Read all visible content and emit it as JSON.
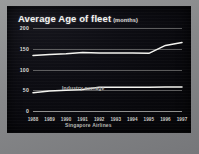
{
  "slide": {
    "title": "Average Age of fleet",
    "subtitle": "(months)"
  },
  "chart_data": {
    "type": "line",
    "title": "Average Age of fleet",
    "subtitle": "(months)",
    "xlabel": "",
    "ylabel": "months",
    "ylim": [
      0,
      200
    ],
    "yticks": [
      0,
      50,
      100,
      150,
      200
    ],
    "ytick_labels": [
      "0",
      "50",
      "100",
      "150",
      "200"
    ],
    "grid": true,
    "legend": "inline-labels",
    "categories": [
      "1988",
      "1989",
      "1990",
      "1991",
      "1992",
      "1993",
      "1994",
      "1995",
      "1996",
      "1997"
    ],
    "series": [
      {
        "name": "Industry average",
        "values": [
          134,
          136,
          138,
          141,
          140,
          140,
          140,
          139,
          158,
          165
        ]
      },
      {
        "name": "Singapore Airlines",
        "values": [
          44,
          48,
          50,
          52,
          57,
          57,
          57,
          57,
          58,
          58
        ]
      }
    ],
    "colors": {
      "line": "#f4f4f0",
      "grid": "#d7d7d2",
      "background": "#0b0b10",
      "frame": "#8f9091",
      "title_text": "#f2f2f0",
      "tick_text": "#dcdcd8"
    }
  }
}
